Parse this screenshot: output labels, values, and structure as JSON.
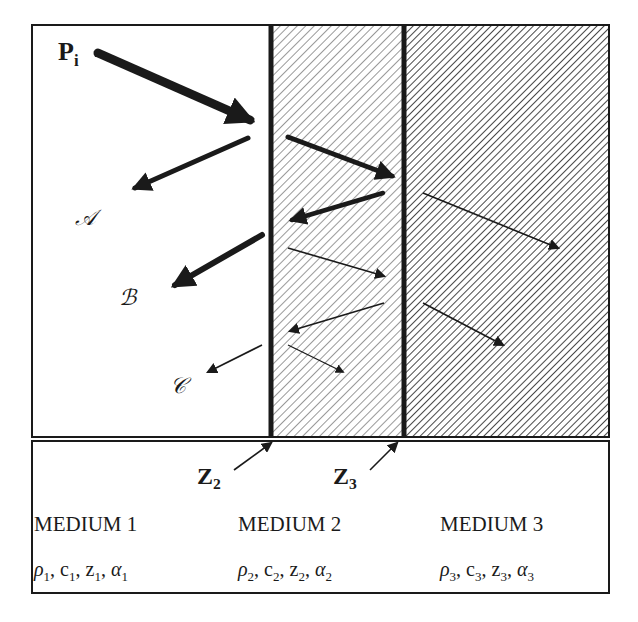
{
  "diagram": {
    "title": "",
    "incident_label": {
      "main": "P",
      "sub": "i"
    },
    "reflected_labels": [
      "𝒜",
      "ℬ",
      "𝒞"
    ],
    "interfaces": [
      {
        "main": "Z",
        "sub": "2"
      },
      {
        "main": "Z",
        "sub": "3"
      }
    ],
    "media": [
      {
        "name": "MEDIUM 1",
        "props": [
          {
            "sym": "ρ",
            "sub": "1"
          },
          {
            "sym": "c",
            "sub": "1"
          },
          {
            "sym": "z",
            "sub": "1"
          },
          {
            "sym": "α",
            "sub": "1"
          }
        ]
      },
      {
        "name": "MEDIUM 2",
        "props": [
          {
            "sym": "ρ",
            "sub": "2"
          },
          {
            "sym": "c",
            "sub": "2"
          },
          {
            "sym": "z",
            "sub": "2"
          },
          {
            "sym": "α",
            "sub": "2"
          }
        ]
      },
      {
        "name": "MEDIUM 3",
        "props": [
          {
            "sym": "ρ",
            "sub": "3"
          },
          {
            "sym": "c",
            "sub": "3"
          },
          {
            "sym": "z",
            "sub": "3"
          },
          {
            "sym": "α",
            "sub": "3"
          }
        ]
      }
    ],
    "colors": {
      "ink": "#1a1a1a",
      "background": "#ffffff"
    }
  }
}
